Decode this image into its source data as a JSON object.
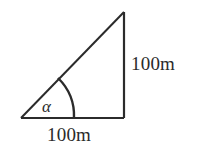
{
  "figure": {
    "type": "right-triangle-diagram",
    "stroke_color": "#2b2b2b",
    "background_color": "#ffffff",
    "labels": {
      "vertical_side": "100m",
      "horizontal_side": "100m",
      "angle": "α"
    },
    "geometry": {
      "left_vertex": [
        21,
        118
      ],
      "right_vertex": [
        124,
        118
      ],
      "apex": [
        124,
        12
      ],
      "arc_start": [
        58,
        78
      ],
      "arc_end": [
        74,
        118
      ],
      "arc_radius": 53
    }
  }
}
